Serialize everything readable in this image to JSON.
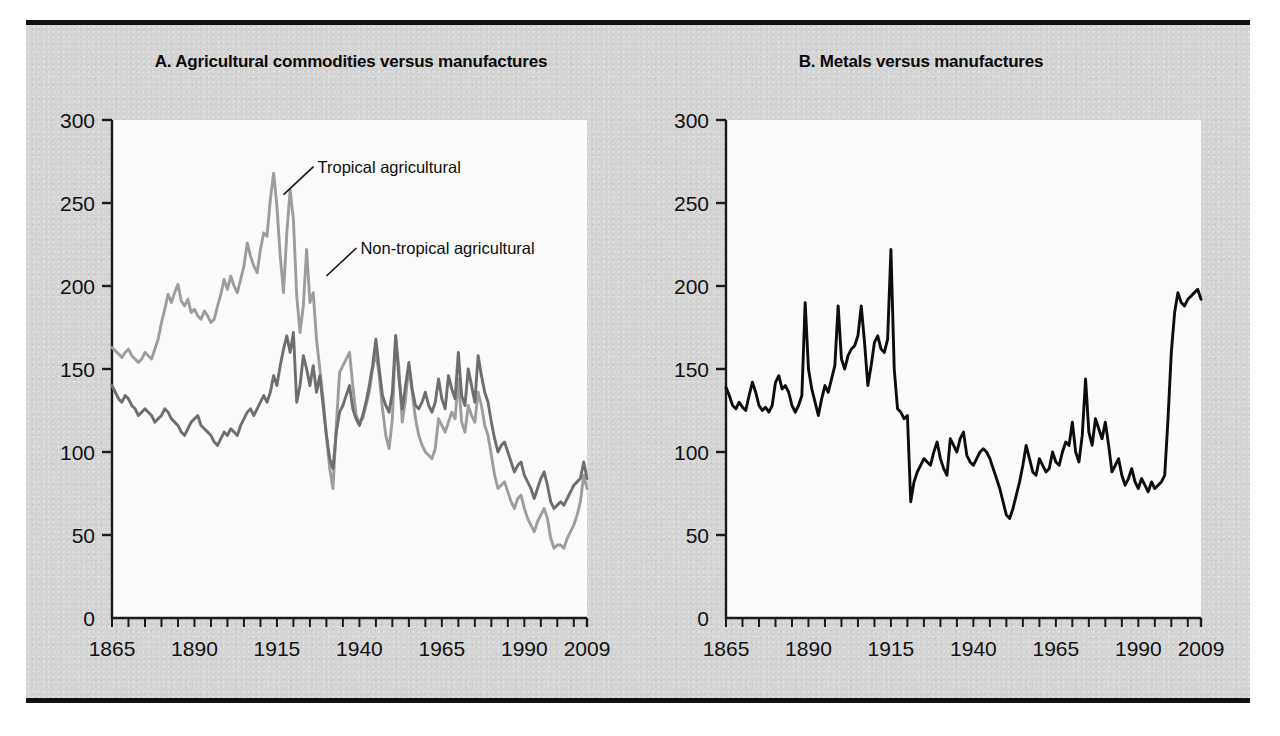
{
  "figure": {
    "background_color": "#d4d4d4",
    "plot_background_color": "#fbfbfb",
    "rule_color": "#111111"
  },
  "panels": [
    {
      "id": "A",
      "title": "A. Agricultural commodities versus manufactures",
      "annotations": [
        {
          "text": "Tropical agricultural",
          "x": 1917,
          "y": 255
        },
        {
          "text": "Non-tropical agricultural",
          "x": 1930,
          "y": 206
        }
      ]
    },
    {
      "id": "B",
      "title": "B. Metals versus manufactures",
      "annotations": []
    }
  ],
  "chart_data": [
    {
      "type": "line",
      "title": "A. Agricultural commodities versus manufactures",
      "xlabel": "",
      "ylabel": "",
      "xlim": [
        1865,
        2009
      ],
      "ylim": [
        0,
        300
      ],
      "xticks": [
        1865,
        1890,
        1915,
        1940,
        1965,
        1990,
        2009
      ],
      "xtick_labels": [
        "1865",
        "1890",
        "1915",
        "1940",
        "1965",
        "1990",
        "2009"
      ],
      "yticks": [
        0,
        50,
        100,
        150,
        200,
        250,
        300
      ],
      "ytick_labels": [
        "0",
        "50",
        "100",
        "150",
        "200",
        "250",
        "300"
      ],
      "minor_xtick_interval": 5,
      "grid": false,
      "legend": "annotated-inline",
      "series": [
        {
          "name": "Tropical agricultural",
          "color": "#9d9d9d",
          "x": [
            1865,
            1866,
            1867,
            1868,
            1869,
            1870,
            1871,
            1872,
            1873,
            1874,
            1875,
            1876,
            1877,
            1878,
            1879,
            1880,
            1881,
            1882,
            1883,
            1884,
            1885,
            1886,
            1887,
            1888,
            1889,
            1890,
            1891,
            1892,
            1893,
            1894,
            1895,
            1896,
            1897,
            1898,
            1899,
            1900,
            1901,
            1902,
            1903,
            1904,
            1905,
            1906,
            1907,
            1908,
            1909,
            1910,
            1911,
            1912,
            1913,
            1914,
            1915,
            1916,
            1917,
            1918,
            1919,
            1920,
            1921,
            1922,
            1923,
            1924,
            1925,
            1926,
            1927,
            1928,
            1929,
            1930,
            1931,
            1932,
            1933,
            1934,
            1935,
            1936,
            1937,
            1938,
            1939,
            1940,
            1941,
            1942,
            1943,
            1944,
            1945,
            1946,
            1947,
            1948,
            1949,
            1950,
            1951,
            1952,
            1953,
            1954,
            1955,
            1956,
            1957,
            1958,
            1959,
            1960,
            1961,
            1962,
            1963,
            1964,
            1965,
            1966,
            1967,
            1968,
            1969,
            1970,
            1971,
            1972,
            1973,
            1974,
            1975,
            1976,
            1977,
            1978,
            1979,
            1980,
            1981,
            1982,
            1983,
            1984,
            1985,
            1986,
            1987,
            1988,
            1989,
            1990,
            1991,
            1992,
            1993,
            1994,
            1995,
            1996,
            1997,
            1998,
            1999,
            2000,
            2001,
            2002,
            2003,
            2004,
            2005,
            2006,
            2007,
            2008,
            2009
          ],
          "y": [
            163,
            161,
            159,
            157,
            160,
            162,
            158,
            156,
            154,
            156,
            160,
            158,
            156,
            162,
            168,
            178,
            186,
            195,
            190,
            196,
            201,
            191,
            188,
            192,
            184,
            186,
            182,
            180,
            185,
            182,
            178,
            180,
            188,
            195,
            204,
            198,
            206,
            200,
            196,
            204,
            212,
            226,
            218,
            212,
            208,
            222,
            232,
            230,
            252,
            268,
            248,
            218,
            196,
            232,
            258,
            240,
            194,
            172,
            188,
            222,
            190,
            196,
            168,
            150,
            132,
            110,
            90,
            78,
            116,
            148,
            152,
            156,
            160,
            140,
            122,
            118,
            120,
            128,
            136,
            150,
            160,
            146,
            126,
            110,
            102,
            120,
            170,
            150,
            118,
            132,
            152,
            136,
            120,
            110,
            104,
            100,
            98,
            96,
            102,
            120,
            116,
            112,
            118,
            124,
            120,
            144,
            118,
            112,
            128,
            122,
            118,
            136,
            128,
            116,
            110,
            98,
            86,
            78,
            80,
            82,
            76,
            70,
            66,
            72,
            74,
            66,
            60,
            56,
            52,
            58,
            62,
            66,
            60,
            48,
            42,
            44,
            44,
            42,
            48,
            52,
            56,
            62,
            70,
            86,
            78
          ]
        },
        {
          "name": "Non-tropical agricultural",
          "color": "#6e6e6e",
          "x": [
            1865,
            1866,
            1867,
            1868,
            1869,
            1870,
            1871,
            1872,
            1873,
            1874,
            1875,
            1876,
            1877,
            1878,
            1879,
            1880,
            1881,
            1882,
            1883,
            1884,
            1885,
            1886,
            1887,
            1888,
            1889,
            1890,
            1891,
            1892,
            1893,
            1894,
            1895,
            1896,
            1897,
            1898,
            1899,
            1900,
            1901,
            1902,
            1903,
            1904,
            1905,
            1906,
            1907,
            1908,
            1909,
            1910,
            1911,
            1912,
            1913,
            1914,
            1915,
            1916,
            1917,
            1918,
            1919,
            1920,
            1921,
            1922,
            1923,
            1924,
            1925,
            1926,
            1927,
            1928,
            1929,
            1930,
            1931,
            1932,
            1933,
            1934,
            1935,
            1936,
            1937,
            1938,
            1939,
            1940,
            1941,
            1942,
            1943,
            1944,
            1945,
            1946,
            1947,
            1948,
            1949,
            1950,
            1951,
            1952,
            1953,
            1954,
            1955,
            1956,
            1957,
            1958,
            1959,
            1960,
            1961,
            1962,
            1963,
            1964,
            1965,
            1966,
            1967,
            1968,
            1969,
            1970,
            1971,
            1972,
            1973,
            1974,
            1975,
            1976,
            1977,
            1978,
            1979,
            1980,
            1981,
            1982,
            1983,
            1984,
            1985,
            1986,
            1987,
            1988,
            1989,
            1990,
            1991,
            1992,
            1993,
            1994,
            1995,
            1996,
            1997,
            1998,
            1999,
            2000,
            2001,
            2002,
            2003,
            2004,
            2005,
            2006,
            2007,
            2008,
            2009
          ],
          "y": [
            140,
            136,
            132,
            130,
            134,
            132,
            128,
            126,
            122,
            124,
            126,
            124,
            122,
            118,
            120,
            122,
            126,
            124,
            120,
            118,
            116,
            112,
            110,
            114,
            118,
            120,
            122,
            116,
            114,
            112,
            110,
            106,
            104,
            108,
            112,
            110,
            114,
            112,
            110,
            116,
            120,
            124,
            126,
            122,
            126,
            130,
            134,
            130,
            136,
            146,
            140,
            152,
            162,
            170,
            160,
            172,
            130,
            140,
            158,
            150,
            140,
            152,
            136,
            146,
            128,
            110,
            96,
            90,
            112,
            124,
            128,
            134,
            140,
            126,
            120,
            116,
            122,
            130,
            140,
            152,
            168,
            150,
            134,
            128,
            124,
            136,
            170,
            144,
            126,
            140,
            154,
            138,
            128,
            126,
            130,
            136,
            128,
            124,
            130,
            144,
            132,
            126,
            146,
            138,
            132,
            160,
            134,
            128,
            150,
            140,
            130,
            158,
            146,
            136,
            130,
            118,
            108,
            100,
            104,
            106,
            100,
            94,
            88,
            92,
            94,
            86,
            82,
            78,
            72,
            78,
            84,
            88,
            80,
            70,
            66,
            68,
            70,
            68,
            72,
            76,
            80,
            82,
            84,
            94,
            84
          ]
        }
      ]
    },
    {
      "type": "line",
      "title": "B. Metals versus manufactures",
      "xlabel": "",
      "ylabel": "",
      "xlim": [
        1865,
        2009
      ],
      "ylim": [
        0,
        300
      ],
      "xticks": [
        1865,
        1890,
        1915,
        1940,
        1965,
        1990,
        2009
      ],
      "xtick_labels": [
        "1865",
        "1890",
        "1915",
        "1940",
        "1965",
        "1990",
        "2009"
      ],
      "yticks": [
        0,
        50,
        100,
        150,
        200,
        250,
        300
      ],
      "ytick_labels": [
        "0",
        "50",
        "100",
        "150",
        "200",
        "250",
        "300"
      ],
      "minor_xtick_interval": 5,
      "grid": false,
      "legend": "none",
      "series": [
        {
          "name": "Metals",
          "color": "#0d0d0d",
          "x": [
            1865,
            1866,
            1867,
            1868,
            1869,
            1870,
            1871,
            1872,
            1873,
            1874,
            1875,
            1876,
            1877,
            1878,
            1879,
            1880,
            1881,
            1882,
            1883,
            1884,
            1885,
            1886,
            1887,
            1888,
            1889,
            1890,
            1891,
            1892,
            1893,
            1894,
            1895,
            1896,
            1897,
            1898,
            1899,
            1900,
            1901,
            1902,
            1903,
            1904,
            1905,
            1906,
            1907,
            1908,
            1909,
            1910,
            1911,
            1912,
            1913,
            1914,
            1915,
            1916,
            1917,
            1918,
            1919,
            1920,
            1921,
            1922,
            1923,
            1924,
            1925,
            1926,
            1927,
            1928,
            1929,
            1930,
            1931,
            1932,
            1933,
            1934,
            1935,
            1936,
            1937,
            1938,
            1939,
            1940,
            1941,
            1942,
            1943,
            1944,
            1945,
            1946,
            1947,
            1948,
            1949,
            1950,
            1951,
            1952,
            1953,
            1954,
            1955,
            1956,
            1957,
            1958,
            1959,
            1960,
            1961,
            1962,
            1963,
            1964,
            1965,
            1966,
            1967,
            1968,
            1969,
            1970,
            1971,
            1972,
            1973,
            1974,
            1975,
            1976,
            1977,
            1978,
            1979,
            1980,
            1981,
            1982,
            1983,
            1984,
            1985,
            1986,
            1987,
            1988,
            1989,
            1990,
            1991,
            1992,
            1993,
            1994,
            1995,
            1996,
            1997,
            1998,
            1999,
            2000,
            2001,
            2002,
            2003,
            2004,
            2005,
            2006,
            2007,
            2008,
            2009
          ],
          "y": [
            139,
            134,
            128,
            126,
            130,
            127,
            125,
            134,
            142,
            136,
            128,
            125,
            127,
            124,
            128,
            142,
            146,
            138,
            140,
            136,
            128,
            124,
            128,
            134,
            190,
            150,
            138,
            130,
            122,
            132,
            140,
            136,
            144,
            152,
            188,
            156,
            150,
            158,
            162,
            164,
            170,
            188,
            166,
            140,
            152,
            166,
            170,
            162,
            160,
            168,
            222,
            150,
            126,
            124,
            120,
            122,
            70,
            82,
            88,
            92,
            96,
            94,
            92,
            100,
            106,
            96,
            90,
            86,
            108,
            104,
            100,
            108,
            112,
            98,
            94,
            92,
            96,
            100,
            102,
            100,
            96,
            90,
            84,
            78,
            70,
            62,
            60,
            66,
            74,
            82,
            92,
            104,
            96,
            88,
            86,
            96,
            92,
            88,
            90,
            100,
            94,
            92,
            100,
            106,
            104,
            118,
            100,
            94,
            110,
            144,
            112,
            104,
            120,
            114,
            108,
            118,
            104,
            88,
            92,
            96,
            86,
            80,
            84,
            90,
            82,
            78,
            84,
            80,
            76,
            82,
            78,
            80,
            82,
            86,
            120,
            160,
            184,
            196,
            190,
            188,
            192,
            194,
            196,
            198,
            192
          ]
        }
      ]
    }
  ]
}
